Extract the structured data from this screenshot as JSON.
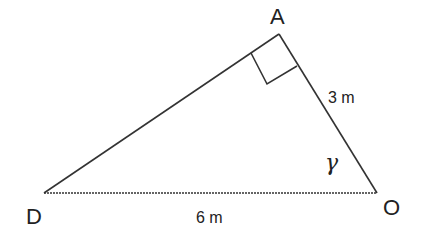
{
  "diagram": {
    "type": "right-triangle",
    "vertices": {
      "A": {
        "label": "A",
        "x": 279,
        "y": 34
      },
      "D": {
        "label": "D",
        "x": 44,
        "y": 193
      },
      "O": {
        "label": "O",
        "x": 377,
        "y": 193
      }
    },
    "right_angle_at": "A",
    "angle_label": {
      "vertex": "O",
      "symbol": "γ"
    },
    "sides": {
      "AO": {
        "label": "3 m"
      },
      "DO": {
        "label": "6 m"
      },
      "AD": {
        "label": ""
      }
    },
    "stroke_color": "#333333",
    "text_color": "#222222"
  }
}
